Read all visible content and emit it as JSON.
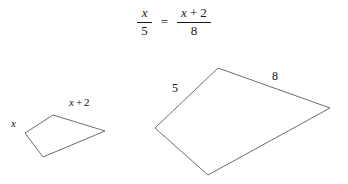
{
  "equation": {
    "left_fraction": {
      "numerator": "x",
      "denominator": "5"
    },
    "relation": "=",
    "right_fraction": {
      "numerator_var": "x",
      "numerator_op": "+",
      "numerator_const": "2",
      "denominator": "8"
    }
  },
  "figures": {
    "small_quadrilateral": {
      "name": "small-quadrilateral",
      "points": "25,133 53,115 105,131 43,157",
      "labels": {
        "left_side": "x",
        "top_side_var": "x",
        "top_side_op": "+",
        "top_side_const": "2"
      }
    },
    "large_quadrilateral": {
      "name": "large-quadrilateral",
      "points": "155,128 218,68 330,108 208,175",
      "labels": {
        "left_side": "5",
        "top_side": "8"
      }
    }
  },
  "style": {
    "stroke_color": "#6e6e6e",
    "text_color": "#111111",
    "background": "#ffffff"
  }
}
